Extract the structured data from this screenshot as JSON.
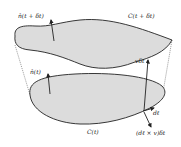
{
  "diagram": {
    "labels": {
      "normal_top": "n̂(t + δt)",
      "curve_top": "C(t + δt)",
      "normal_bottom": "n̂(t)",
      "v_dt": "vδt",
      "dl": "dℓ",
      "curve_bottom": "C(t)",
      "cross": "(dℓ × v)δt"
    },
    "colors": {
      "fill": "#dcdcdc",
      "stroke": "#222222",
      "background": "#ffffff"
    }
  }
}
